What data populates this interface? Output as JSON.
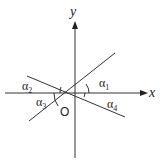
{
  "diagram": {
    "type": "coordinate-axes-with-lines",
    "axes": {
      "x_label": "x",
      "y_label": "y",
      "origin_label": "O"
    },
    "angles": [
      {
        "id": "alpha1",
        "label": "α",
        "subscript": "1"
      },
      {
        "id": "alpha2",
        "label": "α",
        "subscript": "2"
      },
      {
        "id": "alpha3",
        "label": "α",
        "subscript": "3"
      },
      {
        "id": "alpha4",
        "label": "α",
        "subscript": "4"
      }
    ],
    "colors": {
      "stroke": "#333333",
      "background": "#ffffff"
    }
  }
}
